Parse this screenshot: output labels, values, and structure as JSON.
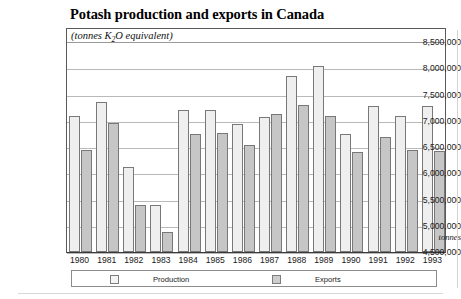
{
  "chart_data": {
    "type": "bar",
    "title": "Potash production and exports in Canada",
    "subtitle_prefix": "(tonnes K",
    "subtitle_sub": "2",
    "subtitle_suffix": "O equivalent)",
    "xlabel": "",
    "ylabel": "tonnes",
    "ylim": [
      4500000,
      8500000
    ],
    "ytick_step": 500000,
    "grid": true,
    "legend_position": "bottom",
    "categories": [
      "1980",
      "1981",
      "1982",
      "1983",
      "1984",
      "1985",
      "1986",
      "1987",
      "1988",
      "1989",
      "1990",
      "1991",
      "1992",
      "1993"
    ],
    "ytick_labels": [
      "8,500,000",
      "8,000,000",
      "7,500,000",
      "7,000,000",
      "6,500,000",
      "6,000,000",
      "5,500,000",
      "5,000,000",
      "4,500,000"
    ],
    "ytick_values": [
      8500000,
      8000000,
      7500000,
      7000000,
      6500000,
      6000000,
      5500000,
      5000000,
      4500000
    ],
    "series": [
      {
        "name": "Production",
        "color": "#efefef",
        "values": [
          7100000,
          7360000,
          6120000,
          5400000,
          7200000,
          7200000,
          6930000,
          7080000,
          7850000,
          8050000,
          6740000,
          7280000,
          7090000,
          7290000
        ]
      },
      {
        "name": "Exports",
        "color": "#c6c6c6",
        "values": [
          6450000,
          6950000,
          5400000,
          4880000,
          6740000,
          6760000,
          6530000,
          7130000,
          7300000,
          7100000,
          6400000,
          6700000,
          6440000,
          6420000
        ]
      }
    ]
  },
  "legend": {
    "production_label": "Production",
    "exports_label": "Exports"
  }
}
